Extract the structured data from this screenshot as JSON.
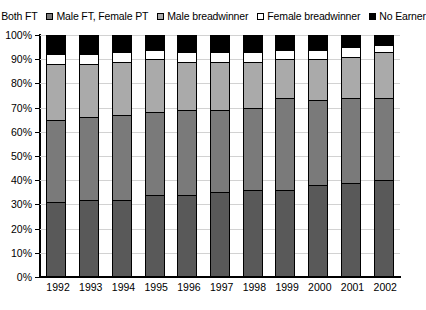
{
  "legend": {
    "items": [
      {
        "label": "Both FT",
        "color": "#595959",
        "icon": "square-swatch-icon"
      },
      {
        "label": "Male FT, Female PT",
        "color": "#7a7a7a",
        "icon": "square-swatch-icon"
      },
      {
        "label": "Male breadwinner",
        "color": "#aaaaaa",
        "icon": "square-swatch-icon"
      },
      {
        "label": "Female breadwinner",
        "color": "#ffffff",
        "icon": "square-swatch-icon"
      },
      {
        "label": "No Earner",
        "color": "#000000",
        "icon": "square-swatch-icon"
      }
    ]
  },
  "axis": {
    "y_ticks": [
      "0%",
      "10%",
      "20%",
      "30%",
      "40%",
      "50%",
      "60%",
      "70%",
      "80%",
      "90%",
      "100%"
    ]
  },
  "chart_data": {
    "type": "bar",
    "stacked": true,
    "stacked_mode": "percent",
    "title": "",
    "subtitle": "",
    "xlabel": "",
    "ylabel": "",
    "ylim": [
      0,
      100
    ],
    "grid": true,
    "legend_position": "top",
    "categories": [
      "1992",
      "1993",
      "1994",
      "1995",
      "1996",
      "1997",
      "1998",
      "1999",
      "2000",
      "2001",
      "2002"
    ],
    "series": [
      {
        "name": "Both FT",
        "color": "#595959",
        "values": [
          31,
          32,
          32,
          34,
          34,
          35,
          36,
          36,
          38,
          39,
          40
        ]
      },
      {
        "name": "Male FT, Female PT",
        "color": "#7a7a7a",
        "values": [
          34,
          34,
          35,
          34,
          35,
          34,
          34,
          38,
          35,
          35,
          34
        ]
      },
      {
        "name": "Male breadwinner",
        "color": "#aaaaaa",
        "values": [
          23,
          22,
          22,
          22,
          20,
          20,
          19,
          16,
          17,
          17,
          19
        ]
      },
      {
        "name": "Female breadwinner",
        "color": "#ffffff",
        "values": [
          4,
          4,
          4,
          4,
          4,
          4,
          4,
          4,
          4,
          4,
          3
        ]
      },
      {
        "name": "No Earner",
        "color": "#000000",
        "values": [
          8,
          8,
          7,
          6,
          7,
          7,
          7,
          6,
          6,
          5,
          4
        ]
      }
    ]
  }
}
